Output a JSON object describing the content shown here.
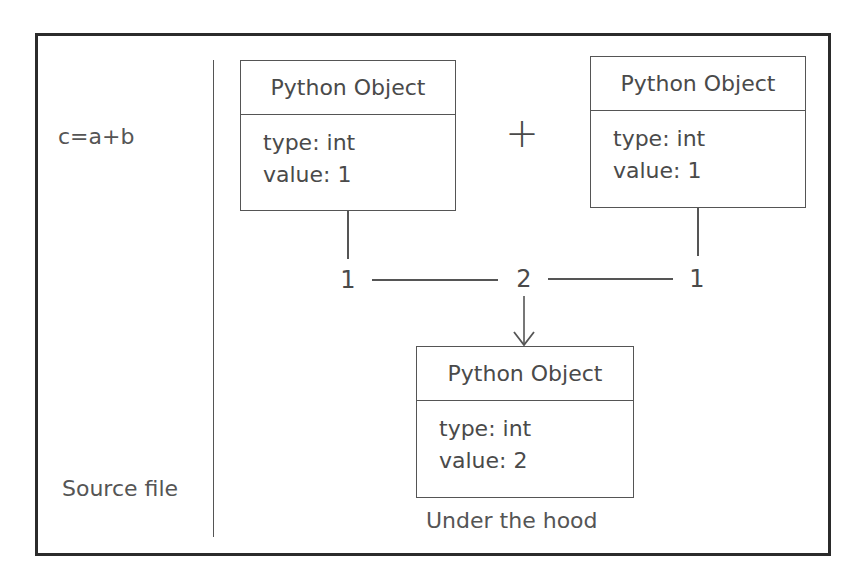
{
  "left_panel": {
    "expression": "c=a+b",
    "caption": "Source file"
  },
  "operator": "+",
  "objects": [
    {
      "title": "Python Object",
      "type_line": "type: int",
      "value_line": "value: 1"
    },
    {
      "title": "Python Object",
      "type_line": "type: int",
      "value_line": "value: 1"
    },
    {
      "title": "Python Object",
      "type_line": "type: int",
      "value_line": "value: 2"
    }
  ],
  "flow": {
    "left_operand": "1",
    "result": "2",
    "right_operand": "1"
  },
  "right_panel": {
    "caption": "Under the hood"
  },
  "colors": {
    "border": "#2b2b2b",
    "line": "#555555",
    "text": "#4a4a4a"
  }
}
